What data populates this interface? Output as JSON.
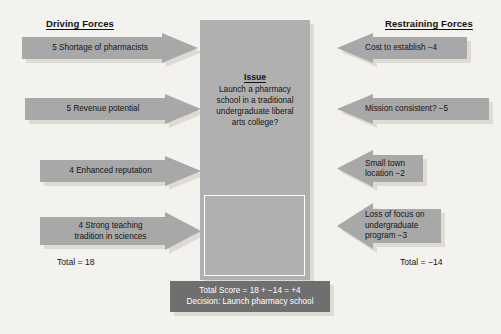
{
  "diagram": {
    "background_color": "#f4f2ee",
    "arrow_color": "#a8a8a8",
    "shadow_color": "#dedad4",
    "score_box_color": "#6f6f6f"
  },
  "left_column": {
    "header": "Driving Forces",
    "forces": [
      {
        "label": "5 Shortage of pharmacists",
        "score": 5
      },
      {
        "label": "5 Revenue potential",
        "score": 5
      },
      {
        "label": "4 Enhanced reputation",
        "score": 4
      },
      {
        "label": "4 Strong teaching\ntradition in sciences",
        "score": 4
      }
    ],
    "total": "Total = 18"
  },
  "right_column": {
    "header": "Restraining Forces",
    "forces": [
      {
        "label": "Cost to establish  −4",
        "score": -4
      },
      {
        "label": "Mission consistent?  −5",
        "score": -5
      },
      {
        "label": "Small town\nlocation −2",
        "score": -2
      },
      {
        "label": "Loss of focus on\nundergraduate\nprogram −3",
        "score": -3
      }
    ],
    "total": "Total = −14"
  },
  "issue": {
    "title": "Issue",
    "text": "Launch a pharmacy\nschool in a traditional\nundergraduate liberal\narts college?"
  },
  "score_box": {
    "line1": "Total Score = 18 + −14 = +4",
    "line2": "Decision: Launch pharmacy school"
  }
}
